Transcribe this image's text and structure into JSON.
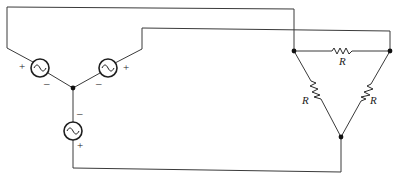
{
  "diagram": {
    "sources": [
      {
        "id": "left",
        "plus_label": "+",
        "minus_label": "–",
        "symbol": "~"
      },
      {
        "id": "right",
        "plus_label": "+",
        "minus_label": "–",
        "symbol": "~"
      },
      {
        "id": "bottom",
        "plus_label": "+",
        "minus_label": "–",
        "symbol": "~"
      }
    ],
    "resistors": [
      {
        "id": "top",
        "label": "R"
      },
      {
        "id": "left",
        "label": "R"
      },
      {
        "id": "right",
        "label": "R"
      }
    ],
    "nodes": [
      "wye-center",
      "delta-left",
      "delta-right",
      "delta-bottom"
    ]
  }
}
